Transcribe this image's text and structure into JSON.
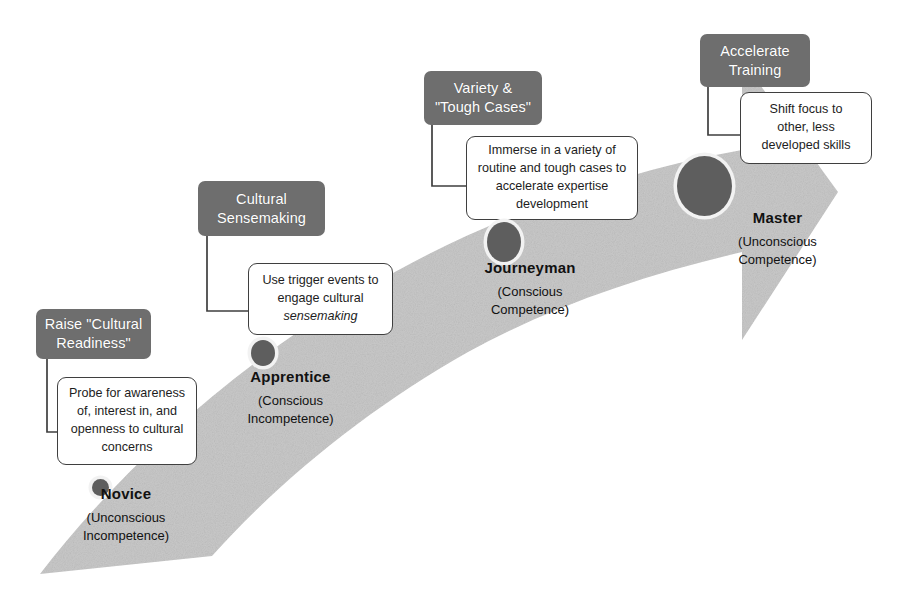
{
  "diagram": {
    "arrow": {
      "name": "progression-arrow",
      "fill": "#c9c9c9",
      "direction": "lower-left to upper-right"
    },
    "node_color": "#5e5e5e",
    "label_color": "#6e6e6e"
  },
  "stages": [
    {
      "id": "novice",
      "action_label": "Raise \"Cultural Readiness\"",
      "action_line1": "Raise \"Cultural",
      "action_line2": "Readiness\"",
      "callout_lines": [
        "Probe for awareness",
        "of, interest in, and",
        "openness to cultural",
        "concerns"
      ],
      "stage_name": "Novice",
      "state_line1": "(Unconscious",
      "state_line2": "Incompetence)"
    },
    {
      "id": "apprentice",
      "action_label": "Cultural Sensemaking",
      "action_line1": "Cultural",
      "action_line2": "Sensemaking",
      "callout_lines": [
        "Use trigger events to",
        "engage cultural",
        "sensemaking"
      ],
      "callout_italic_last": "sensemaking",
      "stage_name": "Apprentice",
      "state_line1": "(Conscious",
      "state_line2": "Incompetence)"
    },
    {
      "id": "journeyman",
      "action_label": "Variety & \"Tough Cases\"",
      "action_line1": "Variety &",
      "action_line2": "\"Tough Cases\"",
      "callout_lines": [
        "Immerse in a variety of",
        "routine and tough cases to",
        "accelerate expertise",
        "development"
      ],
      "stage_name": "Journeyman",
      "state_line1": "(Conscious",
      "state_line2": "Competence)"
    },
    {
      "id": "master",
      "action_label": "Accelerate Training",
      "action_line1": "Accelerate",
      "action_line2": "Training",
      "callout_lines": [
        "Shift focus to",
        "other, less",
        "developed skills"
      ],
      "stage_name": "Master",
      "state_line1": "(Unconscious",
      "state_line2": "Competence)"
    }
  ]
}
